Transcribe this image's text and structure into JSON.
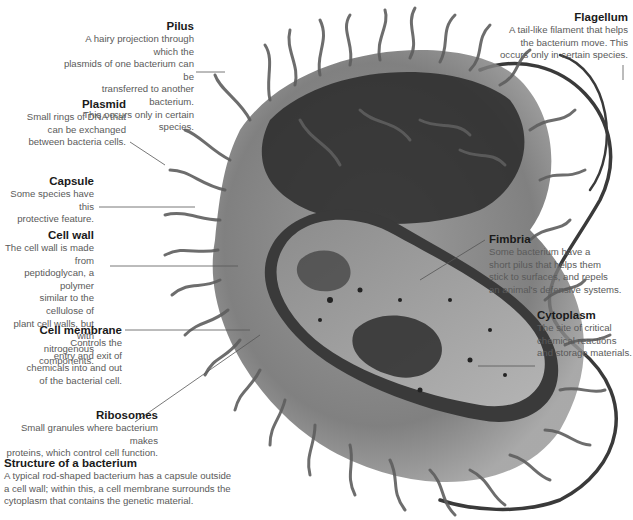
{
  "diagram": {
    "title": "Structure of a bacterium",
    "description": "A typical rod-shaped bacterium has a capsule outside\na cell wall; within this, a cell membrane surrounds the\ncytoplasm that contains the genetic material.",
    "labels": [
      {
        "id": "pilus",
        "title": "Pilus",
        "text": "A hairy projection through which the\nplasmids of one bacterium can be\ntransferred to another bacterium.\nThis occurs only in certain species."
      },
      {
        "id": "plasmid",
        "title": "Plasmid",
        "text": "Small rings of DNA that\ncan be exchanged\nbetween bacteria cells."
      },
      {
        "id": "capsule",
        "title": "Capsule",
        "text": "Some species have this\nprotective feature."
      },
      {
        "id": "cell-wall",
        "title": "Cell wall",
        "text": "The cell wall is made from\npeptidoglycan, a polymer\nsimilar to the cellulose of\nplant cell walls, but with\nnitrogenous components."
      },
      {
        "id": "cell-membrane",
        "title": "Cell membrane",
        "text": "Controls the\nentry and exit of\nchemicals into and out\nof the bacterial cell."
      },
      {
        "id": "ribosomes",
        "title": "Ribosomes",
        "text": "Small granules where bacterium makes\nproteins, which control cell function."
      },
      {
        "id": "flagellum",
        "title": "Flagellum",
        "text": "A tail-like filament that helps\nthe bacterium move. This\noccurs only in certain species."
      },
      {
        "id": "fimbria",
        "title": "Fimbria",
        "text": "Some bacterium have a\nshort pilus that helps them\nstick to surfaces, and repels\nan animal's defensive systems."
      },
      {
        "id": "cytoplasm",
        "title": "Cytoplasm",
        "text": "The site of critical\nchemical reactions\nand storage materials."
      }
    ]
  },
  "colors": {
    "title_text": "#1a1a1a",
    "body_text": "#5a5a5a",
    "leader_line": "#555555",
    "bacterium_dark": "#2a2a2a",
    "bacterium_mid": "#6e6e6e",
    "bacterium_light": "#a8a8a8"
  }
}
